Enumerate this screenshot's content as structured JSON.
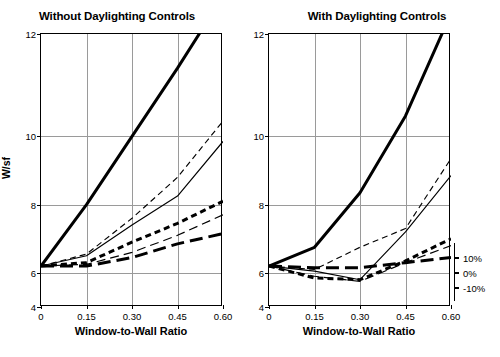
{
  "figure": {
    "width": 500,
    "height": 357,
    "background": "#ffffff",
    "axis_color": "#000000",
    "grid_color": "#9a9a9a"
  },
  "chart_data": [
    {
      "type": "line",
      "title": "Without Daylighting Controls",
      "xlabel": "Window-to-Wall Ratio",
      "ylabel": "W/sf",
      "x": [
        0,
        0.15,
        0.3,
        0.45,
        0.6
      ],
      "xlim": [
        0,
        0.6
      ],
      "ylim": [
        4,
        12
      ],
      "xticks": [
        "0",
        "0.15",
        "0.30",
        "0.45",
        "0.60"
      ],
      "yticks": [
        "4",
        "6",
        "8",
        "10",
        "12"
      ],
      "grid": true,
      "legend": "none",
      "series": [
        {
          "name": "thick-solid",
          "style": "solid",
          "weight": "thick",
          "values": [
            5.2,
            7.0,
            9.0,
            11.0,
            13.1
          ]
        },
        {
          "name": "thin-dashed",
          "style": "dashed",
          "weight": "thin",
          "values": [
            5.2,
            5.55,
            6.6,
            7.8,
            9.45
          ]
        },
        {
          "name": "thin-solid",
          "style": "solid",
          "weight": "thin",
          "values": [
            5.2,
            5.5,
            6.4,
            7.25,
            8.85
          ]
        },
        {
          "name": "thick-short-dash",
          "style": "short-dash",
          "weight": "thick",
          "values": [
            5.2,
            5.3,
            5.9,
            6.45,
            7.1
          ]
        },
        {
          "name": "thin-long-dash",
          "style": "long-dash",
          "weight": "thin",
          "values": [
            5.2,
            5.25,
            5.6,
            6.1,
            6.7
          ]
        },
        {
          "name": "thick-long-dash",
          "style": "long-dash",
          "weight": "thick",
          "values": [
            5.2,
            5.2,
            5.45,
            5.85,
            6.15
          ]
        }
      ]
    },
    {
      "type": "line",
      "title": "With Daylighting Controls",
      "xlabel": "Window-to-Wall Ratio",
      "ylabel": "",
      "x": [
        0,
        0.15,
        0.3,
        0.45,
        0.6
      ],
      "xlim": [
        0,
        0.6
      ],
      "ylim": [
        4,
        12
      ],
      "xticks": [
        "0",
        "0.15",
        "0.30",
        "0.45",
        "0.60"
      ],
      "yticks": [
        "4",
        "6",
        "8",
        "10",
        "12"
      ],
      "grid": true,
      "legend": "right",
      "legend_entries": [
        "10%",
        "0%",
        "-10%"
      ],
      "series": [
        {
          "name": "thick-solid",
          "style": "solid",
          "weight": "thick",
          "values": [
            5.2,
            5.75,
            7.35,
            9.6,
            12.6
          ]
        },
        {
          "name": "thin-dashed",
          "style": "dashed",
          "weight": "thin",
          "values": [
            5.2,
            5.1,
            5.75,
            6.3,
            8.35
          ]
        },
        {
          "name": "thin-solid",
          "style": "solid",
          "weight": "thin",
          "values": [
            5.2,
            5.05,
            4.8,
            6.2,
            7.85
          ]
        },
        {
          "name": "thick-short-dash",
          "style": "short-dash",
          "weight": "thick",
          "values": [
            5.2,
            4.85,
            4.8,
            5.35,
            6.0
          ]
        },
        {
          "name": "thin-long-dash",
          "style": "long-dash",
          "weight": "thin",
          "values": [
            5.2,
            4.9,
            4.75,
            5.3,
            5.8
          ]
        },
        {
          "name": "thick-long-dash",
          "style": "long-dash",
          "weight": "thick",
          "values": [
            5.2,
            5.15,
            5.15,
            5.3,
            5.45
          ]
        }
      ]
    }
  ]
}
